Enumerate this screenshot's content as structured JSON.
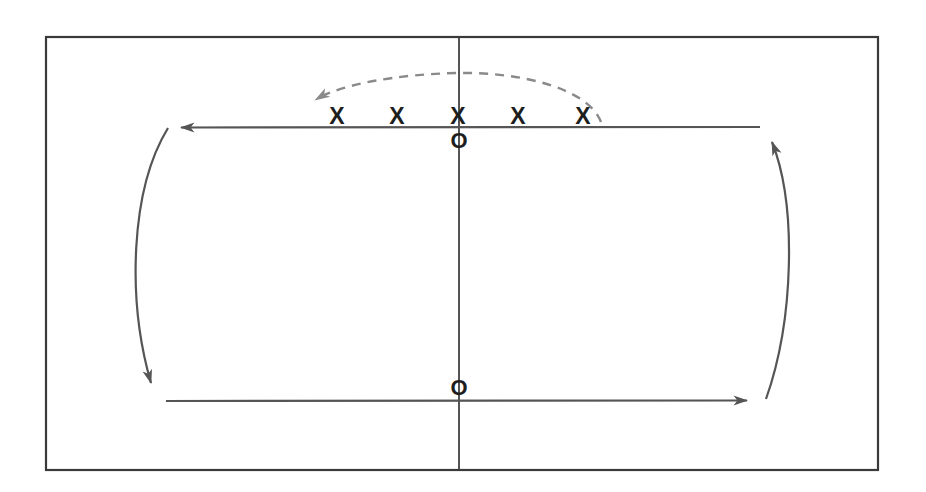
{
  "canvas": {
    "width": 926,
    "height": 492,
    "background": "#ffffff"
  },
  "frame": {
    "name": "diagram-border",
    "x": 46,
    "y": 37,
    "width": 832,
    "height": 433,
    "stroke": "#3a3a3a",
    "stroke_width": 2.2
  },
  "colors": {
    "ink": "#555555",
    "ink_dark": "#1e1e1e",
    "frame": "#3a3a3a",
    "dashed": "#8a8a8a"
  },
  "diagram": {
    "title": "",
    "type": "flow-loop-diagram",
    "center_line": {
      "label": "center-vertical-line",
      "x": 459,
      "y_top": 38,
      "y_bottom": 469,
      "stroke": "#555555",
      "stroke_width": 2.0
    },
    "top_arrow": {
      "label": "top-horizontal-arrow",
      "direction": "left",
      "x_start": 760,
      "x_end": 168,
      "y": 127,
      "stroke": "#555555",
      "stroke_width": 2.2
    },
    "bottom_arrow": {
      "label": "bottom-horizontal-arrow",
      "direction": "right",
      "x_start": 166,
      "x_end": 760,
      "y": 401,
      "stroke": "#555555",
      "stroke_width": 2.2
    },
    "left_curve": {
      "label": "left-curved-arrow",
      "direction": "down",
      "from": [
        168,
        128
      ],
      "to": [
        160,
        396
      ],
      "bulge_x": 129,
      "stroke": "#555555",
      "stroke_width": 2.2
    },
    "right_curve": {
      "label": "right-curved-arrow",
      "direction": "up",
      "from": [
        766,
        399
      ],
      "to": [
        762,
        130
      ],
      "bulge_x": 797,
      "stroke": "#555555",
      "stroke_width": 2.2
    },
    "dashed_arc": {
      "label": "dashed-curved-arrow",
      "direction": "left",
      "from": [
        601,
        122
      ],
      "to": [
        306,
        103
      ],
      "apex": [
        459,
        74
      ],
      "stroke": "#8a8a8a",
      "stroke_width": 2.4,
      "dash_pattern": "9 7"
    }
  },
  "markers": {
    "x_row": {
      "label": "X",
      "name": "x-marker",
      "count": 5,
      "y": 118,
      "positions": [
        337,
        397,
        458,
        518,
        583
      ]
    },
    "o_markers": {
      "label": "O",
      "name": "o-marker",
      "count": 2,
      "positions": [
        {
          "x": 459,
          "y": 141,
          "place": "top-center"
        },
        {
          "x": 459,
          "y": 388,
          "place": "bottom-center"
        }
      ]
    }
  },
  "legend": {
    "x_meaning": "X",
    "o_meaning": "O"
  }
}
